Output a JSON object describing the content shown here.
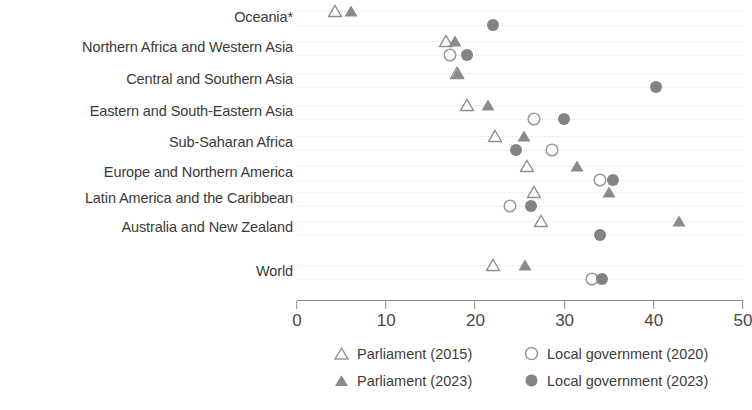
{
  "chart_data": {
    "type": "scatter",
    "title": "",
    "xlabel": "",
    "ylabel": "",
    "xlim": [
      0,
      50
    ],
    "xticks": [
      0,
      10,
      20,
      30,
      40,
      50
    ],
    "xtick_labels": [
      "0",
      "10",
      "20",
      "30",
      "40",
      "50"
    ],
    "grid": true,
    "grid_axis": "y",
    "legend_position": "bottom",
    "categories": [
      "Oceania*",
      "Northern Africa and Western Asia",
      "Central and Southern Asia",
      "Eastern and South-Eastern Asia",
      "Sub-Saharan Africa",
      "Europe and Northern America",
      "Latin America and the Caribbean",
      "Australia and New Zealand",
      "World"
    ],
    "series": [
      {
        "name": "Parliament (2015)",
        "marker": "triangle-open",
        "color": "#8f8f8f",
        "values": [
          4.3,
          16.7,
          17.9,
          19.1,
          22.2,
          25.8,
          26.6,
          27.3,
          22.0
        ]
      },
      {
        "name": "Parliament (2023)",
        "marker": "triangle-filled",
        "color": "#8a8a8a",
        "values": [
          6.0,
          17.7,
          18.0,
          21.4,
          25.5,
          31.4,
          35.0,
          42.8,
          25.6
        ]
      },
      {
        "name": "Local government (2020)",
        "marker": "circle-open",
        "color": "#9a9a9a",
        "values": [
          null,
          17.2,
          null,
          26.6,
          28.6,
          34.0,
          23.9,
          null,
          33.1
        ]
      },
      {
        "name": "Local government (2023)",
        "marker": "circle-filled",
        "color": "#838383",
        "values": [
          22.0,
          19.1,
          40.2,
          29.9,
          24.5,
          35.4,
          26.2,
          34.0,
          34.2
        ]
      }
    ],
    "row_layout": {
      "row_tops": [
        18,
        48,
        80,
        112,
        143,
        173,
        199,
        228,
        272
      ],
      "series_row_offsets": [
        -7,
        -7,
        7,
        7
      ]
    }
  },
  "legend": {
    "items": [
      {
        "label": "Parliament (2015)",
        "symbol": "triangle-open-icon"
      },
      {
        "label": "Local government (2020)",
        "symbol": "circle-open-icon"
      },
      {
        "label": "Parliament (2023)",
        "symbol": "triangle-filled-icon"
      },
      {
        "label": "Local government (2023)",
        "symbol": "circle-filled-icon"
      }
    ]
  }
}
